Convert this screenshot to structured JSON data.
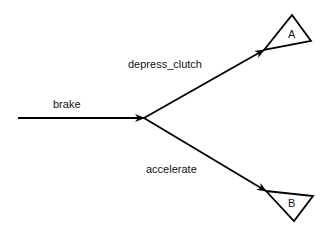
{
  "diagram": {
    "type": "state-transition",
    "edges": [
      {
        "label": "brake",
        "from": "start",
        "to": "junction"
      },
      {
        "label": "depress_clutch",
        "from": "junction",
        "to": "A"
      },
      {
        "label": "accelerate",
        "from": "junction",
        "to": "B"
      }
    ],
    "nodes": [
      {
        "id": "A",
        "label": "A",
        "shape": "triangle"
      },
      {
        "id": "B",
        "label": "B",
        "shape": "triangle"
      }
    ],
    "colors": {
      "stroke": "#000000",
      "background": "#ffffff"
    }
  }
}
